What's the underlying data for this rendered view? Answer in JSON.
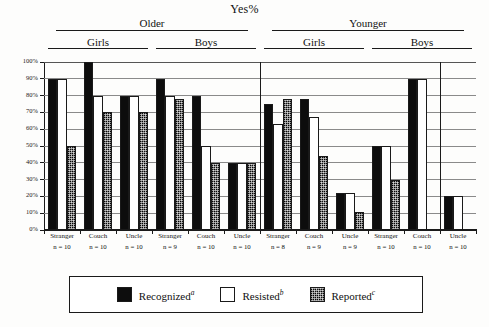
{
  "chart_data": {
    "type": "bar",
    "title": "Yes%",
    "xlabel": "",
    "ylabel": "",
    "ylim": [
      0,
      100
    ],
    "ytick_labels": [
      "0%",
      "10%",
      "20%",
      "30%",
      "40%",
      "50%",
      "60%",
      "70%",
      "80%",
      "90%",
      "100%"
    ],
    "ytick_values": [
      0,
      10,
      20,
      30,
      40,
      50,
      60,
      70,
      80,
      90,
      100
    ],
    "grid": true,
    "legend_position": "bottom",
    "series": [
      {
        "name": "Recognized",
        "superscript": "a",
        "style": "solid-black",
        "color": "#0d0d0d",
        "values": [
          90,
          100,
          80,
          90,
          80,
          40,
          75,
          78,
          22,
          50,
          90,
          20
        ]
      },
      {
        "name": "Resisted",
        "superscript": "b",
        "style": "open-white",
        "color": "#ffffff",
        "values": [
          90,
          80,
          80,
          80,
          50,
          40,
          63,
          67,
          22,
          50,
          90,
          20
        ]
      },
      {
        "name": "Reported",
        "superscript": "c",
        "style": "hatched-gray",
        "color": "#4a4a4a",
        "values": [
          50,
          70,
          70,
          78,
          40,
          40,
          78,
          44,
          11,
          30,
          0,
          0
        ]
      }
    ],
    "categories": [
      {
        "name": "Stranger",
        "n_label": "n = 10",
        "age": "Older",
        "sex": "Girls"
      },
      {
        "name": "Couch",
        "n_label": "n = 10",
        "age": "Older",
        "sex": "Girls"
      },
      {
        "name": "Uncle",
        "n_label": "n = 10",
        "age": "Older",
        "sex": "Girls"
      },
      {
        "name": "Stranger",
        "n_label": "n = 9",
        "age": "Older",
        "sex": "Boys"
      },
      {
        "name": "Couch",
        "n_label": "n = 10",
        "age": "Older",
        "sex": "Boys"
      },
      {
        "name": "Uncle",
        "n_label": "n = 10",
        "age": "Older",
        "sex": "Boys"
      },
      {
        "name": "Stranger",
        "n_label": "n = 8",
        "age": "Younger",
        "sex": "Girls"
      },
      {
        "name": "Couch",
        "n_label": "n = 9",
        "age": "Younger",
        "sex": "Girls"
      },
      {
        "name": "Uncle",
        "n_label": "n = 9",
        "age": "Younger",
        "sex": "Girls"
      },
      {
        "name": "Stranger",
        "n_label": "n = 10",
        "age": "Younger",
        "sex": "Boys"
      },
      {
        "name": "Couch",
        "n_label": "n = 10",
        "age": "Younger",
        "sex": "Boys"
      },
      {
        "name": "Uncle",
        "n_label": "n = 10",
        "age": "Younger",
        "sex": "Boys"
      }
    ],
    "supergroups": [
      {
        "label": "Older",
        "span": [
          0,
          5
        ]
      },
      {
        "label": "Younger",
        "span": [
          6,
          11
        ]
      }
    ],
    "subgroups": [
      {
        "label": "Girls",
        "span": [
          0,
          2
        ]
      },
      {
        "label": "Boys",
        "span": [
          3,
          5
        ]
      },
      {
        "label": "Girls",
        "span": [
          6,
          8
        ]
      },
      {
        "label": "Boys",
        "span": [
          9,
          11
        ]
      }
    ]
  },
  "legend": {
    "items": [
      {
        "label": "Recognized",
        "sup": "a"
      },
      {
        "label": "Resisted",
        "sup": "b"
      },
      {
        "label": "Reported",
        "sup": "c"
      }
    ]
  }
}
